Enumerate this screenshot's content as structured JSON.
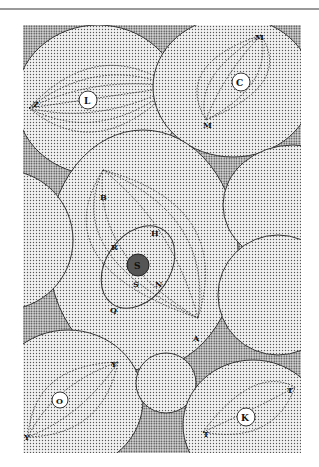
{
  "figure": {
    "labels": {
      "L": "L",
      "Z1": "Z",
      "Z2": "Z",
      "C": "C",
      "M1": "M",
      "M2": "M",
      "B": "B",
      "H": "H",
      "R": "R",
      "S_center": "S",
      "S_lower": "S",
      "N": "N",
      "Q": "Q",
      "A": "A",
      "Y1": "Y",
      "Y2": "Y",
      "O": "O",
      "K": "K",
      "T1": "T",
      "T2": "T"
    }
  }
}
